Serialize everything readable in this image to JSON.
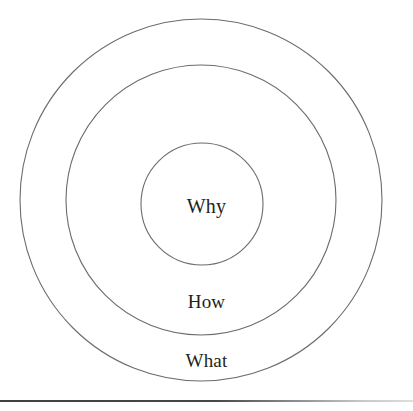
{
  "figure": {
    "name": "golden-circle-diagram",
    "background_color": "#ffffff",
    "stroke_color": "#6b6b70",
    "text_color": "#231f20",
    "rule_color": "#46464b"
  },
  "labels": {
    "inner": "Why",
    "middle": "How",
    "outer": "What"
  },
  "chart_data": {
    "type": "pie",
    "title": "",
    "subtitle": "",
    "xlabel": "",
    "ylabel": "",
    "layout": "concentric-rings",
    "legend": "none",
    "grid": false,
    "center": {
      "x": 201,
      "y": 200
    },
    "rings": [
      {
        "label": "What",
        "level": 1,
        "radius": 181,
        "fill": "none",
        "stroke": "#6b6b70",
        "stroke_width": 1.1,
        "label_position": {
          "x": 201,
          "y": 361
        }
      },
      {
        "label": "How",
        "level": 2,
        "radius": 135,
        "fill": "none",
        "stroke": "#6b6b70",
        "stroke_width": 1.1,
        "label_position": {
          "x": 201,
          "y": 302
        }
      },
      {
        "label": "Why",
        "level": 3,
        "radius": 61,
        "fill": "none",
        "stroke": "#6b6b70",
        "stroke_width": 1.1,
        "label_position": {
          "x": 201,
          "y": 206
        }
      }
    ],
    "categories": [
      "What",
      "How",
      "Why"
    ],
    "values": [
      181,
      135,
      61
    ]
  },
  "divider": {
    "name": "bottom-rule",
    "y": 400
  }
}
